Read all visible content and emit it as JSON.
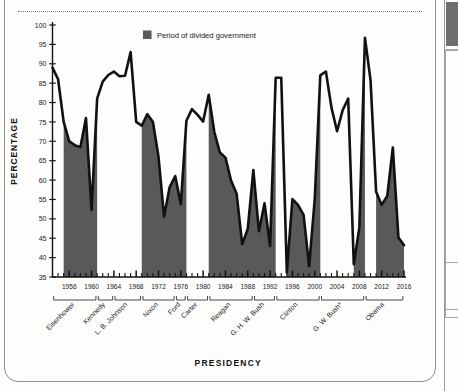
{
  "figure": {
    "ylabel": "PERCENTAGE",
    "xlabel": "PRESIDENCY",
    "legend_label": "Period of divided government",
    "legend_swatch_color": "#595959",
    "line_color": "#111111",
    "fill_color": "#595959",
    "background_color": "#fdfdfc"
  },
  "chart_data": {
    "type": "line",
    "title": "",
    "subtitle": "",
    "xlabel": "PRESIDENCY",
    "ylabel": "PERCENTAGE",
    "xlim": [
      1953,
      2016
    ],
    "ylim": [
      35,
      100
    ],
    "ytick_step": 5,
    "grid": false,
    "legend_position": "top-center",
    "legend": [
      {
        "label": "Period of divided government",
        "color": "#595959",
        "kind": "shaded-area"
      }
    ],
    "yticks": [
      35,
      40,
      45,
      50,
      55,
      60,
      65,
      70,
      75,
      80,
      85,
      90,
      95,
      100
    ],
    "xticks": [
      1956,
      1960,
      1964,
      1968,
      1972,
      1976,
      1980,
      1984,
      1988,
      1992,
      1996,
      2000,
      2004,
      2008,
      2012,
      2016
    ],
    "x": [
      1953,
      1954,
      1955,
      1956,
      1957,
      1958,
      1959,
      1960,
      1961,
      1962,
      1963,
      1964,
      1965,
      1966,
      1967,
      1968,
      1969,
      1970,
      1971,
      1972,
      1973,
      1974,
      1975,
      1976,
      1977,
      1978,
      1979,
      1980,
      1981,
      1982,
      1983,
      1984,
      1985,
      1986,
      1987,
      1988,
      1989,
      1990,
      1991,
      1992,
      1993,
      1994,
      1995,
      1996,
      1997,
      1998,
      1999,
      2000,
      2001,
      2002,
      2003,
      2004,
      2005,
      2006,
      2007,
      2008,
      2009,
      2010,
      2011,
      2012,
      2013,
      2014,
      2015,
      2016
    ],
    "series": [
      {
        "name": "Presidential success rate on congressional votes",
        "color": "#111111",
        "values": [
          89,
          86,
          75,
          70,
          69,
          68.5,
          76,
          52.3,
          81,
          85.4,
          87.1,
          88,
          86.8,
          86.9,
          93,
          75,
          74,
          77,
          75,
          66,
          50.6,
          58.2,
          61,
          53.8,
          75.3,
          78.3,
          76.8,
          75.1,
          82,
          72.4,
          67.1,
          65.8,
          59.9,
          56.5,
          43.5,
          47.4,
          62.6,
          46.8,
          54,
          43,
          86.4,
          86.4,
          36.2,
          55.1,
          53.6,
          51,
          37.8,
          55,
          87,
          88,
          78.7,
          72.6,
          78,
          81,
          38.3,
          47.8,
          96.7,
          85.8,
          57,
          53.6,
          55.9,
          68.4,
          45.2,
          43.2
        ]
      }
    ],
    "divided_government_spans": [
      {
        "start": 1955,
        "end": 1961
      },
      {
        "start": 1969,
        "end": 1977
      },
      {
        "start": 1981,
        "end": 1993
      },
      {
        "start": 1995,
        "end": 2001
      },
      {
        "start": 2007,
        "end": 2009
      },
      {
        "start": 2011,
        "end": 2016
      }
    ],
    "presidencies": [
      {
        "label": "Eisenhower",
        "start": 1953,
        "end": 1961
      },
      {
        "label": "Kennedy",
        "start": 1961,
        "end": 1964
      },
      {
        "label": "L. B. Johnson",
        "start": 1964,
        "end": 1969
      },
      {
        "label": "Nixon",
        "start": 1969,
        "end": 1975
      },
      {
        "label": "Ford",
        "start": 1975,
        "end": 1977
      },
      {
        "label": "Carter",
        "start": 1977,
        "end": 1981
      },
      {
        "label": "Reagan",
        "start": 1981,
        "end": 1989
      },
      {
        "label": "G. H. W. Bush",
        "start": 1989,
        "end": 1993
      },
      {
        "label": "Clinton",
        "start": 1993,
        "end": 2001
      },
      {
        "label": "G. W. Bush*",
        "start": 2001,
        "end": 2009
      },
      {
        "label": "Obama",
        "start": 2009,
        "end": 2016
      }
    ]
  }
}
